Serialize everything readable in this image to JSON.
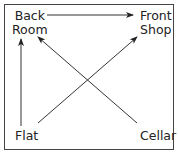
{
  "diagram": {
    "nodes": [
      {
        "id": "back_room",
        "line1": "Back",
        "line2": "Room"
      },
      {
        "id": "front_shop",
        "line1": "Front",
        "line2": "Shop"
      },
      {
        "id": "flat",
        "label": "Flat"
      },
      {
        "id": "cellar",
        "label": "Cellar"
      }
    ],
    "edges": [
      {
        "from": "back_room",
        "to": "front_shop"
      },
      {
        "from": "flat",
        "to": "back_room"
      },
      {
        "from": "flat",
        "to": "front_shop"
      },
      {
        "from": "cellar",
        "to": "back_room"
      }
    ],
    "colors": {
      "line": "#333333",
      "text": "#222222",
      "frame": "#444444"
    }
  }
}
